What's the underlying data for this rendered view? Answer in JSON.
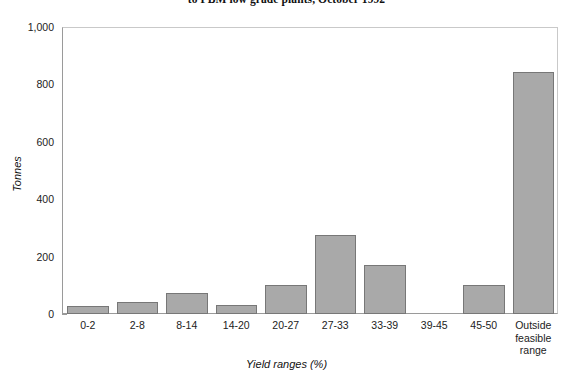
{
  "chart_data": {
    "type": "bar",
    "title": "to PBM low grade plants, October 1992",
    "xlabel": "Yield ranges (%)",
    "ylabel": "Tonnes",
    "categories": [
      "0-2",
      "2-8",
      "8-14",
      "14-20",
      "20-27",
      "27-33",
      "33-39",
      "39-45",
      "45-50",
      "Outside feasible range"
    ],
    "values": [
      28,
      42,
      73,
      31,
      100,
      275,
      170,
      0,
      100,
      845
    ],
    "ylim": [
      0,
      1000
    ],
    "yticks": [
      0,
      200,
      400,
      600,
      800,
      1000
    ],
    "ytick_labels": [
      "0",
      "200",
      "400",
      "600",
      "800",
      "1,000"
    ],
    "grid": false,
    "legend": "none",
    "bar_color": "#a9a9a9",
    "bar_edge_color": "#777777"
  },
  "axis": {
    "y_title": "Tonnes",
    "x_title": "Yield ranges (%)"
  },
  "x_tick_lines": [
    [
      "0-2"
    ],
    [
      "2-8"
    ],
    [
      "8-14"
    ],
    [
      "14-20"
    ],
    [
      "20-27"
    ],
    [
      "27-33"
    ],
    [
      "33-39"
    ],
    [
      "39-45"
    ],
    [
      "45-50"
    ],
    [
      "Outside",
      "feasible",
      "range"
    ]
  ]
}
